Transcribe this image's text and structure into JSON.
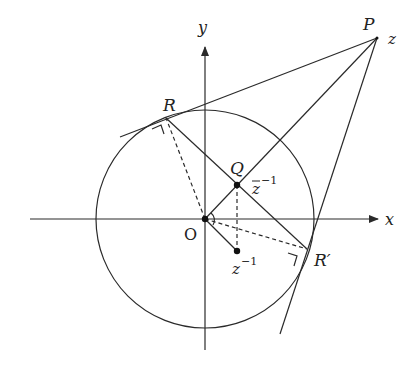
{
  "diagram": {
    "type": "geometry",
    "labels": {
      "x_axis": "x",
      "y_axis": "y",
      "origin": "O",
      "P": "P",
      "z": "z",
      "R": "R",
      "R_prime": "R′",
      "Q": "Q",
      "zbar_inv_base": "z",
      "zbar_inv_exp": "−1",
      "z_inv_base": "z",
      "z_inv_exp": "−1"
    },
    "points": {
      "O": [
        205,
        219
      ],
      "P": [
        377,
        38
      ],
      "R": [
        166,
        118
      ],
      "R_prime": [
        307,
        249
      ],
      "Q": [
        237,
        185
      ],
      "z_inv": [
        237,
        251
      ]
    },
    "circle": {
      "cx": 205,
      "cy": 219,
      "r": 109
    },
    "colors": {
      "stroke": "#2a2a2a",
      "background": "#ffffff"
    }
  }
}
